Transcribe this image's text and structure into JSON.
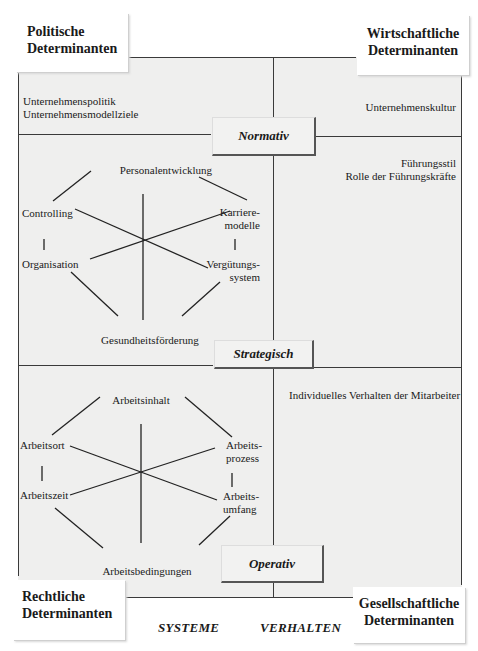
{
  "determinants": {
    "top_left": [
      "Politische",
      "Determinanten"
    ],
    "top_right": [
      "Wirtschaftliche",
      "Determinanten"
    ],
    "bottom_left": [
      "Rechtliche",
      "Determinanten"
    ],
    "bottom_right": [
      "Gesellschaftliche",
      "Determinanten"
    ]
  },
  "levels": {
    "normativ": "Normativ",
    "strategisch": "Strategisch",
    "operativ": "Operativ"
  },
  "normativ": {
    "systeme": [
      "Unternehmenspolitik",
      "Unternehmensmodellziele"
    ],
    "verhalten": [
      "Unternehmenskultur"
    ]
  },
  "strategisch": {
    "systeme": {
      "top": "Personalentwicklung",
      "left_upper": "Controlling",
      "left_lower": "Organisation",
      "right_upper": [
        "Karriere-",
        "modelle"
      ],
      "right_lower": [
        "Vergütungs-",
        "system"
      ],
      "bottom": "Gesundheitsförderung"
    },
    "verhalten": [
      "Führungsstil",
      "Rolle der Führungskräfte"
    ]
  },
  "operativ": {
    "systeme": {
      "top": "Arbeitsinhalt",
      "left_upper": "Arbeitsort",
      "left_lower": "Arbeitszeit",
      "right_upper": [
        "Arbeits-",
        "prozess"
      ],
      "right_lower": [
        "Arbeits-",
        "umfang"
      ],
      "bottom": "Arbeitsbedingungen"
    },
    "verhalten": [
      "Individuelles Verhalten der Mitarbeiter"
    ]
  },
  "axes": {
    "left": "SYSTEME",
    "right": "VERHALTEN"
  }
}
